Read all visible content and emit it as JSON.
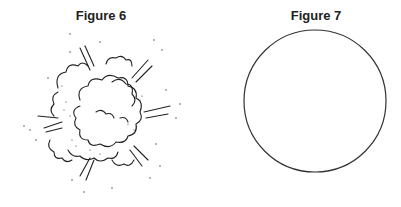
{
  "figures": [
    {
      "label": "Figure 6",
      "depiction": "explosion-cloud"
    },
    {
      "label": "Figure 7",
      "depiction": "circle"
    }
  ]
}
